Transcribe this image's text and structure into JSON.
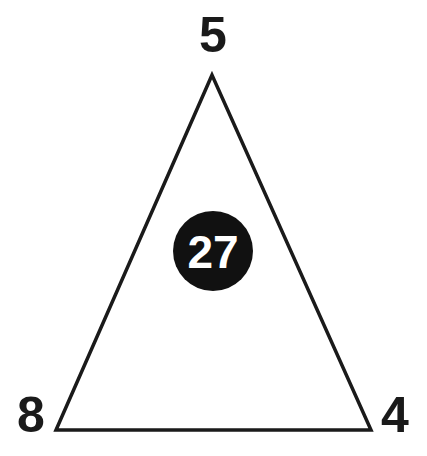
{
  "puzzle": {
    "top_number": "5",
    "left_number": "8",
    "right_number": "4",
    "center_number": "27"
  },
  "colors": {
    "line": "#1a1a1a",
    "circle_fill": "#111111",
    "center_text": "#ffffff",
    "background": "#ffffff"
  }
}
